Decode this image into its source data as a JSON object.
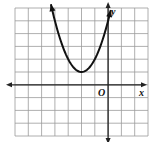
{
  "chart_data": {
    "type": "line",
    "title": "",
    "function": "y = (x + 2)^2 + 1",
    "series": [
      {
        "name": "parabola",
        "points": [
          [
            -4.3,
            6.29
          ],
          [
            -4,
            5
          ],
          [
            -3.5,
            3.25
          ],
          [
            -3,
            2
          ],
          [
            -2.5,
            1.25
          ],
          [
            -2,
            1
          ],
          [
            -1.5,
            1.25
          ],
          [
            -1,
            2
          ],
          [
            -0.5,
            3.25
          ],
          [
            0,
            5
          ],
          [
            0.2,
            5.84
          ]
        ],
        "vertex": [
          -2,
          1
        ],
        "arrows_both_ends": true
      }
    ],
    "xlabel": "x",
    "ylabel": "y",
    "origin_label": "O",
    "xlim": [
      -7,
      3
    ],
    "ylim": [
      -4,
      6
    ],
    "grid": true,
    "grid_step": 1,
    "tick_labels": false
  }
}
